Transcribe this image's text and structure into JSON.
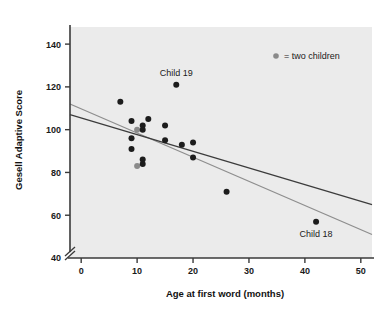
{
  "figure": {
    "background": "#ffffff",
    "plot_background": "#ebebeb",
    "axis_color": "#3a3a3a",
    "point_color": "#1c1c1c",
    "double_point_color": "#8a8a8a",
    "line_dark_color": "#3c3c3c",
    "line_gray_color": "#8e8e8e"
  },
  "chart_data": {
    "type": "scatter",
    "title": "",
    "xlabel": "Age at first word (months)",
    "ylabel": "Gesell Adaptive Score",
    "xlim": [
      -2,
      52
    ],
    "ylim": [
      40,
      148
    ],
    "xticks": [
      0,
      10,
      20,
      30,
      40,
      50
    ],
    "xtick_labels": [
      "0",
      "10",
      "20",
      "30",
      "40",
      "50"
    ],
    "yticks": [
      40,
      60,
      80,
      100,
      120,
      140
    ],
    "ytick_labels": [
      "40",
      "60",
      "80",
      "100",
      "120",
      "140"
    ],
    "grid": false,
    "axis_break_y": 40,
    "legend": {
      "position": "top-right",
      "entries": [
        {
          "marker": "gray-dot",
          "label": "= two children",
          "color": "#8a8a8a"
        }
      ]
    },
    "series": [
      {
        "name": "Children",
        "marker": "filled-circle",
        "points": [
          {
            "x": 7,
            "y": 113,
            "count": 1
          },
          {
            "x": 9,
            "y": 104,
            "count": 1
          },
          {
            "x": 9,
            "y": 96,
            "count": 1
          },
          {
            "x": 9,
            "y": 91,
            "count": 1
          },
          {
            "x": 10,
            "y": 100,
            "count": 2
          },
          {
            "x": 10,
            "y": 83,
            "count": 2
          },
          {
            "x": 11,
            "y": 102,
            "count": 1
          },
          {
            "x": 11,
            "y": 100,
            "count": 1
          },
          {
            "x": 11,
            "y": 86,
            "count": 1
          },
          {
            "x": 11,
            "y": 84,
            "count": 1
          },
          {
            "x": 12,
            "y": 105,
            "count": 1
          },
          {
            "x": 15,
            "y": 102,
            "count": 1
          },
          {
            "x": 15,
            "y": 95,
            "count": 1
          },
          {
            "x": 17,
            "y": 121,
            "count": 1
          },
          {
            "x": 18,
            "y": 93,
            "count": 1
          },
          {
            "x": 20,
            "y": 94,
            "count": 1
          },
          {
            "x": 20,
            "y": 87,
            "count": 1
          },
          {
            "x": 26,
            "y": 71,
            "count": 1
          },
          {
            "x": 42,
            "y": 57,
            "count": 1
          }
        ]
      }
    ],
    "lines": [
      {
        "name": "regression-all-data",
        "color": "#8e8e8e",
        "x_start": -2,
        "y_start": 112,
        "x_end": 52,
        "y_end": 51
      },
      {
        "name": "regression-without-outlier",
        "color": "#3c3c3c",
        "x_start": -2,
        "y_start": 107,
        "x_end": 52,
        "y_end": 65
      }
    ],
    "annotations": [
      {
        "text": "Child 19",
        "x": 17,
        "y": 121,
        "placement": "above"
      },
      {
        "text": "Child 18",
        "x": 42,
        "y": 57,
        "placement": "below"
      }
    ]
  }
}
